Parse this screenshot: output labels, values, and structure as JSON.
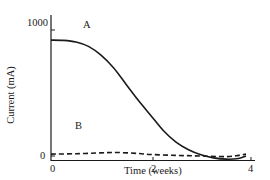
{
  "chart_data": {
    "type": "line",
    "title": "",
    "xlabel": "Time (weeks)",
    "ylabel": "Current (mA)",
    "xlim": [
      0,
      4
    ],
    "ylim": [
      0,
      1000
    ],
    "xticks": [
      "0",
      "2",
      "4"
    ],
    "yticks": [
      "0",
      "1000"
    ],
    "grid": false,
    "legend": "none (curves labeled inline)",
    "series": [
      {
        "name": "A",
        "style": "solid",
        "x": [
          0,
          0.25,
          0.5,
          0.75,
          1.0,
          1.25,
          1.5,
          1.75,
          2.0,
          2.25,
          2.5,
          2.75,
          3.0,
          3.25,
          3.5,
          3.75,
          3.9
        ],
        "values": [
          920,
          918,
          905,
          870,
          800,
          700,
          570,
          440,
          320,
          200,
          110,
          50,
          10,
          -15,
          -25,
          -20,
          0
        ]
      },
      {
        "name": "B",
        "style": "dashed",
        "x": [
          0,
          0.5,
          1.0,
          1.3,
          1.75,
          2.0,
          2.5,
          3.0,
          3.5,
          3.75,
          3.9
        ],
        "values": [
          15,
          18,
          25,
          28,
          20,
          12,
          5,
          0,
          -5,
          5,
          15
        ]
      }
    ],
    "annotations": [
      {
        "text": "A",
        "x": 0.95,
        "y": 1000
      },
      {
        "text": "B",
        "x": 0.5,
        "y": 140
      }
    ]
  },
  "labels": {
    "ytick_top": "1000",
    "ytick_bottom": "0",
    "xtick_0": "0",
    "xtick_2": "2",
    "xtick_4": "4",
    "xlabel": "Time (weeks)",
    "ylabel": "Current (mA)",
    "curve_a": "A",
    "curve_b": "B"
  }
}
